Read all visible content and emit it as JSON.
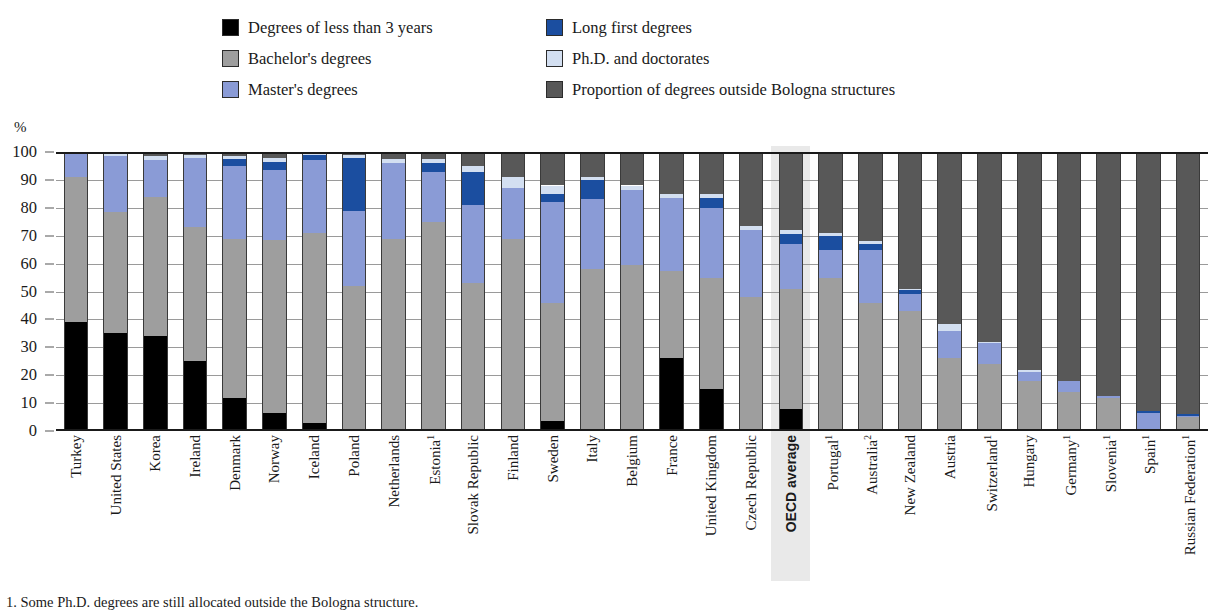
{
  "legend": {
    "items": [
      {
        "label": "Degrees of less than 3 years",
        "key": "short",
        "color": "#000000",
        "col": 1
      },
      {
        "label": "Long first degrees",
        "key": "long_first",
        "color": "#1b4ea0",
        "col": 2
      },
      {
        "label": "Bachelor's degrees",
        "key": "bachelor",
        "color": "#9e9e9e",
        "col": 1
      },
      {
        "label": "Ph.D. and doctorates",
        "key": "phd",
        "color": "#d3dff1",
        "col": 2
      },
      {
        "label": "Master's degrees",
        "key": "master",
        "color": "#8a9bd6",
        "col": 1
      },
      {
        "label": "Proportion of degrees outside Bologna structures",
        "key": "outside",
        "color": "#585858",
        "col": 2
      }
    ]
  },
  "axis": {
    "unit": "%",
    "ticks": [
      "100",
      "90",
      "80",
      "70",
      "60",
      "50",
      "40",
      "30",
      "20",
      "10",
      "0"
    ],
    "min": 0,
    "max": 100
  },
  "footnote": "1. Some Ph.D. degrees are still allocated outside the Bologna structure.",
  "highlight_country": "OECD average",
  "chart_data": {
    "type": "bar",
    "subtype": "stacked-100",
    "title": "",
    "xlabel": "",
    "ylabel": "%",
    "ylim": [
      0,
      100
    ],
    "grid": true,
    "legend_position": "top",
    "series_order": [
      "short",
      "bachelor",
      "master",
      "long_first",
      "phd",
      "outside"
    ],
    "series_names": {
      "short": "Degrees of less than 3 years",
      "bachelor": "Bachelor's degrees",
      "master": "Master's degrees",
      "long_first": "Long first degrees",
      "phd": "Ph.D. and doctorates",
      "outside": "Proportion of degrees outside Bologna structures"
    },
    "categories": [
      "Turkey",
      "United States",
      "Korea",
      "Ireland",
      "Denmark",
      "Norway",
      "Iceland",
      "Poland",
      "Netherlands",
      "Estonia",
      "Slovak Republic",
      "Finland",
      "Sweden",
      "Italy",
      "Belgium",
      "France",
      "United Kingdom",
      "Czech Republic",
      "OECD average",
      "Portugal",
      "Australia",
      "New Zealand",
      "Austria",
      "Switzerland",
      "Hungary",
      "Germany",
      "Slovenia",
      "Spain",
      "Russian Federation"
    ],
    "category_footnotes": {
      "Estonia": "1",
      "Portugal": "1",
      "Australia": "2",
      "Switzerland": "1",
      "Germany": "1",
      "Slovenia": "1",
      "Spain": "1",
      "Russian Federation": "1"
    },
    "rows": [
      {
        "category": "Turkey",
        "short": 39,
        "bachelor": 52,
        "master": 8.5,
        "long_first": 0,
        "phd": 0.5,
        "outside": 0
      },
      {
        "category": "United States",
        "short": 35,
        "bachelor": 43.5,
        "master": 20,
        "long_first": 0,
        "phd": 1.5,
        "outside": 0
      },
      {
        "category": "Korea",
        "short": 34,
        "bachelor": 50,
        "master": 13,
        "long_first": 0,
        "phd": 1.5,
        "outside": 1.5
      },
      {
        "category": "Ireland",
        "short": 25,
        "bachelor": 48,
        "master": 25,
        "long_first": 0,
        "phd": 1,
        "outside": 1
      },
      {
        "category": "Denmark",
        "short": 12,
        "bachelor": 57,
        "master": 26,
        "long_first": 2.5,
        "phd": 1,
        "outside": 1.5
      },
      {
        "category": "Norway",
        "short": 6.5,
        "bachelor": 62,
        "master": 25,
        "long_first": 3,
        "phd": 1.5,
        "outside": 2
      },
      {
        "category": "Iceland",
        "short": 3,
        "bachelor": 68,
        "master": 26,
        "long_first": 2,
        "phd": 0.5,
        "outside": 0.5
      },
      {
        "category": "Poland",
        "short": 0,
        "bachelor": 52,
        "master": 27,
        "long_first": 19,
        "phd": 1,
        "outside": 1
      },
      {
        "category": "Netherlands",
        "short": 0,
        "bachelor": 69,
        "master": 27,
        "long_first": 0,
        "phd": 1.5,
        "outside": 2.5
      },
      {
        "category": "Estonia",
        "short": 0,
        "bachelor": 75,
        "master": 18,
        "long_first": 3,
        "phd": 1.5,
        "outside": 2.5
      },
      {
        "category": "Slovak Republic",
        "short": 0,
        "bachelor": 53,
        "master": 28,
        "long_first": 12,
        "phd": 2,
        "outside": 5
      },
      {
        "category": "Finland",
        "short": 0,
        "bachelor": 69,
        "master": 18,
        "long_first": 0,
        "phd": 4,
        "outside": 9
      },
      {
        "category": "Sweden",
        "short": 3.5,
        "bachelor": 42.5,
        "master": 36,
        "long_first": 3,
        "phd": 3,
        "outside": 12
      },
      {
        "category": "Italy",
        "short": 0,
        "bachelor": 58,
        "master": 25,
        "long_first": 7,
        "phd": 1,
        "outside": 9
      },
      {
        "category": "Belgium",
        "short": 0,
        "bachelor": 59.5,
        "master": 27,
        "long_first": 0,
        "phd": 1.5,
        "outside": 12
      },
      {
        "category": "France",
        "short": 26,
        "bachelor": 31.5,
        "master": 26,
        "long_first": 0,
        "phd": 1.5,
        "outside": 15
      },
      {
        "category": "United Kingdom",
        "short": 15,
        "bachelor": 40,
        "master": 25,
        "long_first": 3.5,
        "phd": 1.5,
        "outside": 15
      },
      {
        "category": "Czech Republic",
        "short": 0,
        "bachelor": 48,
        "master": 24,
        "long_first": 0,
        "phd": 1.5,
        "outside": 26.5
      },
      {
        "category": "OECD average",
        "short": 8,
        "bachelor": 43,
        "master": 16,
        "long_first": 3.5,
        "phd": 1.5,
        "outside": 28
      },
      {
        "category": "Portugal",
        "short": 0,
        "bachelor": 55,
        "master": 10,
        "long_first": 5,
        "phd": 1,
        "outside": 29
      },
      {
        "category": "Australia",
        "short": 0,
        "bachelor": 46,
        "master": 19,
        "long_first": 2,
        "phd": 1,
        "outside": 32
      },
      {
        "category": "New Zealand",
        "short": 0,
        "bachelor": 43,
        "master": 6,
        "long_first": 1.5,
        "phd": 0.5,
        "outside": 49
      },
      {
        "category": "Austria",
        "short": 0,
        "bachelor": 26,
        "master": 10,
        "long_first": 0,
        "phd": 2.5,
        "outside": 61.5
      },
      {
        "category": "Switzerland",
        "short": 0,
        "bachelor": 24,
        "master": 7.5,
        "long_first": 0,
        "phd": 0.5,
        "outside": 68
      },
      {
        "category": "Hungary",
        "short": 0,
        "bachelor": 18,
        "master": 3,
        "long_first": 0,
        "phd": 1,
        "outside": 78
      },
      {
        "category": "Germany",
        "short": 0,
        "bachelor": 14,
        "master": 4,
        "long_first": 0,
        "phd": 0,
        "outside": 82
      },
      {
        "category": "Slovenia",
        "short": 0,
        "bachelor": 12,
        "master": 0.5,
        "long_first": 0,
        "phd": 0,
        "outside": 87.5
      },
      {
        "category": "Spain",
        "short": 0,
        "bachelor": 0,
        "master": 6.5,
        "long_first": 0.5,
        "phd": 0,
        "outside": 93
      },
      {
        "category": "Russian Federation",
        "short": 0,
        "bachelor": 5,
        "master": 0.5,
        "long_first": 0.5,
        "phd": 0,
        "outside": 94
      }
    ]
  }
}
